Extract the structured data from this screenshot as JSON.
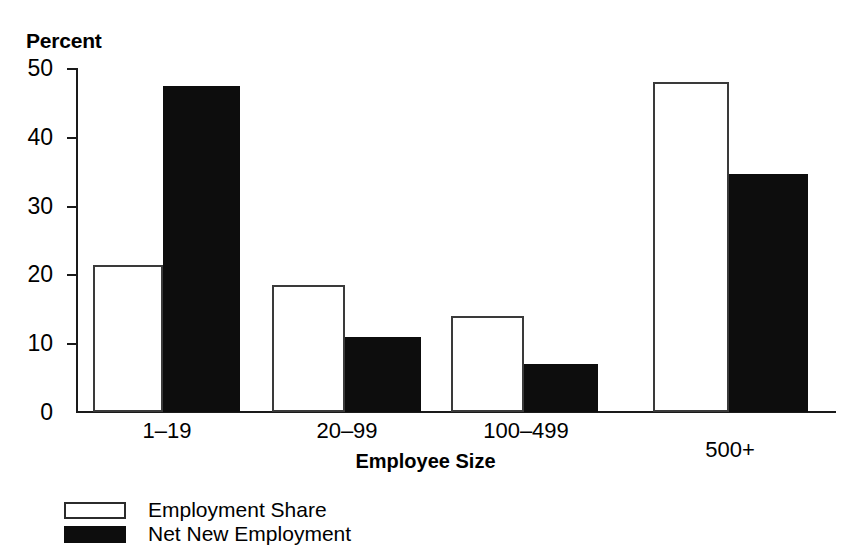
{
  "chart_data": {
    "type": "bar",
    "title": "",
    "ylabel": "Percent",
    "xlabel": "Employee Size",
    "categories": [
      "1–19",
      "20–99",
      "100–499",
      "500+"
    ],
    "series": [
      {
        "name": "Employment Share",
        "style": "light",
        "values": [
          21.4,
          18.5,
          14.0,
          48.0
        ]
      },
      {
        "name": "Net New Employment",
        "style": "dark",
        "values": [
          47.4,
          10.9,
          7.0,
          34.6
        ]
      }
    ],
    "ylim": [
      0,
      50
    ],
    "yticks": [
      0,
      10,
      20,
      30,
      40,
      50
    ],
    "ytick_labels": [
      "0",
      "10",
      "20",
      "30",
      "40",
      "50"
    ],
    "grid": false,
    "legend_position": "bottom-left",
    "colors": {
      "light_fill": "#ffffff",
      "light_edge": "#3a3a3a",
      "dark_fill": "#0d0d0d",
      "axis": "#1a1a1a",
      "text": "#000000",
      "background": "#ffffff"
    }
  },
  "axis": {
    "y_title": "Percent",
    "x_title": "Employee Size",
    "tick_0": "0",
    "tick_10": "10",
    "tick_20": "20",
    "tick_30": "30",
    "tick_40": "40",
    "tick_50": "50"
  },
  "categories": {
    "c0": "1–19",
    "c1": "20–99",
    "c2": "100–499",
    "c3": "500+"
  },
  "legend": {
    "item0": "Employment Share",
    "item1": "Net New Employment"
  }
}
